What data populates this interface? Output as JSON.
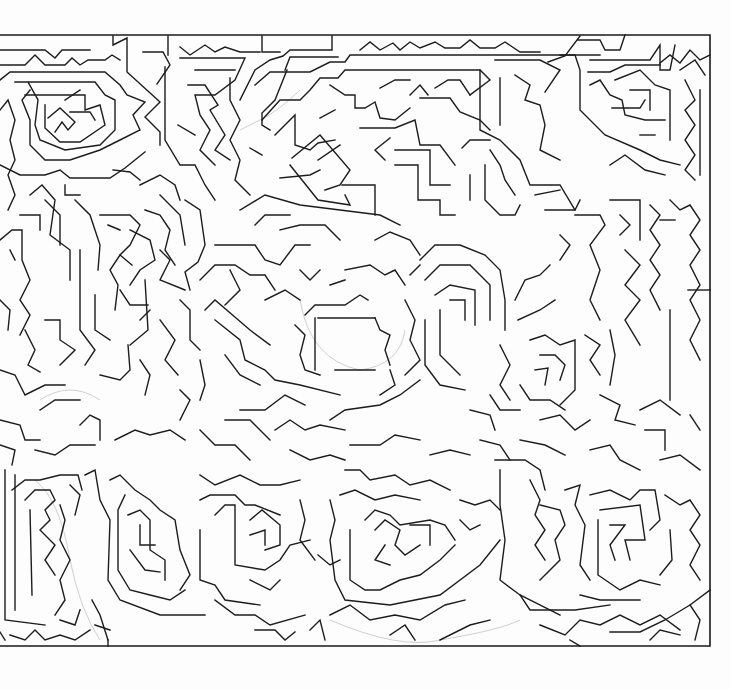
{
  "image": {
    "kind": "hand-drawn maze",
    "background_color": "#ffffff",
    "line_color": "#1c1c1c",
    "pencil_trace_color": "#cfcfcf"
  },
  "maze": {
    "frame": {
      "left": 0,
      "top": 35,
      "right": 710,
      "bottom": 646
    },
    "regions": [
      {
        "name": "top-left-spiral",
        "center": [
          75,
          115
        ]
      },
      {
        "name": "top-center-left-spiral",
        "center": [
          225,
          140
        ]
      },
      {
        "name": "top-center-open-area",
        "center": [
          345,
          185
        ]
      },
      {
        "name": "top-right-spiral",
        "center": [
          640,
          110
        ]
      },
      {
        "name": "mid-left-spiral",
        "center": [
          150,
          260
        ]
      },
      {
        "name": "center-open-area",
        "center": [
          345,
          335
        ]
      },
      {
        "name": "mid-right-spiral",
        "center": [
          455,
          330
        ]
      },
      {
        "name": "right-spiral",
        "center": [
          555,
          380
        ]
      },
      {
        "name": "bottom-left-spiral",
        "center": [
          55,
          560
        ]
      },
      {
        "name": "bottom-center-left-spiral",
        "center": [
          150,
          545
        ]
      },
      {
        "name": "bottom-center-spiral",
        "center": [
          280,
          530
        ]
      },
      {
        "name": "bottom-center-right-spiral",
        "center": [
          405,
          535
        ]
      },
      {
        "name": "bottom-right-spiral",
        "center": [
          640,
          545
        ]
      }
    ]
  }
}
